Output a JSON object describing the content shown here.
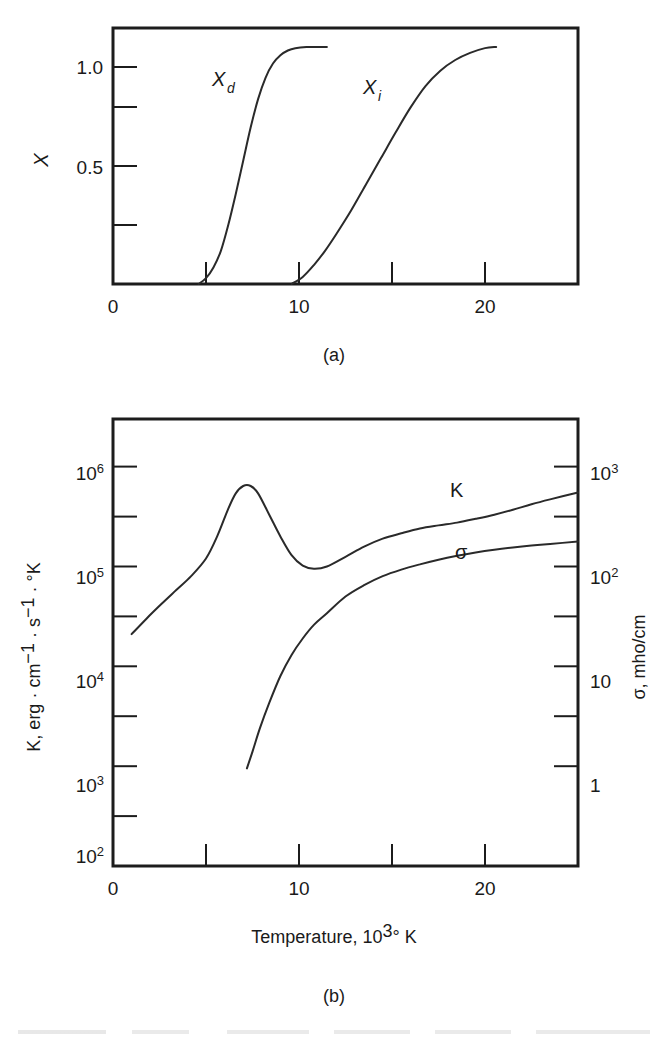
{
  "figure": {
    "panels": [
      {
        "caption": "(a)",
        "ylabel": "X",
        "xlabel": "",
        "y_tick_labels": [
          "0.5",
          "1.0"
        ],
        "x_tick_labels": [
          "0",
          "10",
          "20"
        ]
      },
      {
        "caption": "(b)",
        "ylabel_left_parts": [
          "K, erg · cm",
          "−1",
          " · s",
          "−1",
          " · °K"
        ],
        "ylabel_right": "σ, mho/cm",
        "xlabel_parts": [
          "Temperature, 10",
          "3",
          "° K"
        ],
        "x_tick_labels": [
          "0",
          "10",
          "20"
        ]
      }
    ]
  },
  "chart_data": [
    {
      "type": "line",
      "title": "",
      "panel": "(a)",
      "xlabel": "",
      "ylabel": "X",
      "xlim": [
        0,
        25
      ],
      "ylim": [
        0,
        1.08
      ],
      "grid": false,
      "legend": "inline-labels",
      "x_ticks": [
        0,
        5,
        10,
        15,
        20
      ],
      "x_tick_labels": [
        "0",
        "",
        "10",
        "",
        "20"
      ],
      "y_ticks": [
        0,
        0.25,
        0.5,
        0.75,
        1.0
      ],
      "y_tick_labels": [
        "",
        "",
        "0.5",
        "",
        "1.0"
      ],
      "series": [
        {
          "name": "X_d",
          "label": "X",
          "label_sub": "d",
          "x": [
            4.6,
            5.0,
            5.4,
            5.8,
            6.2,
            6.6,
            7.0,
            7.4,
            7.8,
            8.2,
            8.6,
            9.0,
            9.4,
            9.8,
            10.4,
            11.0,
            11.5
          ],
          "y": [
            0.0,
            0.025,
            0.07,
            0.14,
            0.25,
            0.38,
            0.52,
            0.66,
            0.78,
            0.87,
            0.93,
            0.965,
            0.985,
            0.995,
            1.0,
            1.0,
            1.0
          ]
        },
        {
          "name": "X_i",
          "label": "X",
          "label_sub": "i",
          "x": [
            9.6,
            10.2,
            10.8,
            11.4,
            12.0,
            12.8,
            13.6,
            14.4,
            15.2,
            16.0,
            16.8,
            17.6,
            18.4,
            19.2,
            20.0,
            20.6
          ],
          "y": [
            0.0,
            0.03,
            0.08,
            0.14,
            0.21,
            0.31,
            0.42,
            0.53,
            0.64,
            0.745,
            0.835,
            0.9,
            0.945,
            0.975,
            0.995,
            1.0
          ]
        }
      ]
    },
    {
      "type": "line",
      "title": "",
      "panel": "(b)",
      "xlabel": "Temperature, 10^3 deg K",
      "ylabel_left": "K, erg · cm−1 · s−1 · °K",
      "ylabel_right": "σ, mho/cm",
      "xlim": [
        0,
        25
      ],
      "ylim_left": [
        100,
        3000000
      ],
      "ylim_right": [
        0.1,
        3000
      ],
      "yscale": "log",
      "grid": false,
      "x_ticks": [
        0,
        5,
        10,
        15,
        20
      ],
      "x_tick_labels": [
        "0",
        "",
        "10",
        "",
        "20"
      ],
      "y_ticks_left": [
        100,
        1000,
        10000,
        100000,
        1000000
      ],
      "y_tick_labels_left": [
        "10^2",
        "10^3",
        "10^4",
        "10^5",
        "10^6"
      ],
      "y_ticks_right": [
        1,
        10,
        100,
        1000
      ],
      "y_tick_labels_right": [
        "1",
        "10",
        "10^2",
        "10^3"
      ],
      "series": [
        {
          "name": "K",
          "label": "K",
          "x": [
            1.0,
            1.8,
            2.6,
            3.4,
            4.2,
            5.0,
            5.6,
            6.2,
            6.6,
            7.0,
            7.4,
            7.8,
            8.4,
            9.0,
            9.6,
            10.2,
            10.8,
            11.5,
            12.5,
            13.5,
            14.5,
            15.5,
            16.5,
            17.5,
            18.5,
            19.5,
            20.5,
            21.5,
            22.5,
            23.5,
            25.0
          ],
          "y": [
            21000,
            30000,
            42000,
            58000,
            80000,
            120000,
            200000,
            380000,
            540000,
            640000,
            640000,
            540000,
            330000,
            200000,
            130000,
            102000,
            95000,
            100000,
            125000,
            158000,
            190000,
            215000,
            240000,
            258000,
            275000,
            300000,
            330000,
            370000,
            420000,
            470000,
            550000
          ]
        },
        {
          "name": "sigma",
          "label": "σ",
          "x": [
            7.2,
            7.5,
            7.9,
            8.4,
            9.0,
            9.6,
            10.2,
            10.8,
            11.5,
            12.5,
            13.5,
            14.5,
            15.5,
            16.5,
            17.5,
            18.5,
            19.5,
            20.5,
            21.5,
            22.5,
            23.5,
            25.0
          ],
          "y": [
            950,
            1400,
            2400,
            4300,
            8000,
            13000,
            19000,
            26000,
            34000,
            50000,
            65000,
            80000,
            93000,
            105000,
            117000,
            128000,
            138000,
            147000,
            155000,
            162000,
            168000,
            178000
          ]
        }
      ]
    }
  ]
}
